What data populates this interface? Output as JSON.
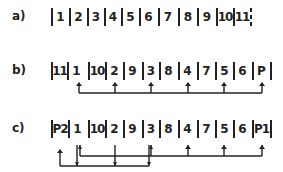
{
  "rows": [
    {
      "label": "a)",
      "cells": [
        "1",
        "2",
        "3",
        "4",
        "5",
        "6",
        "7",
        "8",
        "9",
        "10",
        "11"
      ],
      "end_marker": "dashed"
    },
    {
      "label": "b)",
      "cells": [
        "11",
        "1",
        "10",
        "2",
        "9",
        "3",
        "8",
        "4",
        "7",
        "5",
        "6",
        "P"
      ],
      "connections": [
        {
          "from_cells": [
            "1",
            "2",
            "3",
            "4",
            "5",
            "P"
          ],
          "direction": "up"
        }
      ]
    },
    {
      "label": "c)",
      "cells": [
        "P2",
        "1",
        "10",
        "2",
        "9",
        "3",
        "8",
        "4",
        "7",
        "5",
        "6",
        "P1"
      ],
      "connections": [
        {
          "from_cells": [
            "1",
            "2",
            "3",
            "4",
            "5",
            "P1"
          ],
          "direction": "up"
        },
        {
          "from_cells": [
            "P2",
            "1",
            "2",
            "3"
          ],
          "direction": "mixed"
        }
      ]
    }
  ]
}
